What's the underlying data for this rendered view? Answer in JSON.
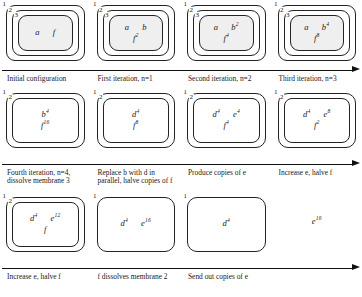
{
  "diagram": {
    "rows": [
      {
        "id": "row-1",
        "cells": [
          {
            "id": "cell-1-1",
            "membranes": [
              "1",
              "2",
              "3"
            ],
            "shaded_inner": true,
            "object_lines": [
              [
                {
                  "symbol": "a",
                  "exp": ""
                },
                {
                  "symbol": "f",
                  "exp": ""
                }
              ]
            ],
            "free_objects": []
          },
          {
            "id": "cell-1-2",
            "membranes": [
              "1",
              "2",
              "3"
            ],
            "shaded_inner": true,
            "object_lines": [
              [
                {
                  "symbol": "a",
                  "exp": ""
                },
                {
                  "symbol": "b",
                  "exp": ""
                }
              ],
              [
                {
                  "symbol": "f",
                  "exp": "2"
                }
              ]
            ],
            "free_objects": []
          },
          {
            "id": "cell-1-3",
            "membranes": [
              "1",
              "2",
              "3"
            ],
            "shaded_inner": true,
            "object_lines": [
              [
                {
                  "symbol": "a",
                  "exp": ""
                },
                {
                  "symbol": "b",
                  "exp": "2"
                }
              ],
              [
                {
                  "symbol": "f",
                  "exp": "4"
                }
              ]
            ],
            "free_objects": []
          },
          {
            "id": "cell-1-4",
            "membranes": [
              "1",
              "2",
              "3"
            ],
            "shaded_inner": true,
            "object_lines": [
              [
                {
                  "symbol": "a",
                  "exp": ""
                },
                {
                  "symbol": "b",
                  "exp": "4"
                }
              ],
              [
                {
                  "symbol": "f",
                  "exp": "8"
                }
              ]
            ],
            "free_objects": []
          }
        ],
        "captions": [
          "Initial configuration",
          "First iteration, n=1",
          "Second iteration, n=2",
          "Third iteration, n=3"
        ]
      },
      {
        "id": "row-2",
        "cells": [
          {
            "id": "cell-2-1",
            "membranes": [
              "1",
              "2"
            ],
            "shaded_inner": false,
            "object_lines": [
              [
                {
                  "symbol": "b",
                  "exp": "4"
                }
              ],
              [
                {
                  "symbol": "f",
                  "exp": "16"
                }
              ]
            ],
            "free_objects": []
          },
          {
            "id": "cell-2-2",
            "membranes": [
              "1",
              "2"
            ],
            "shaded_inner": false,
            "object_lines": [
              [
                {
                  "symbol": "d",
                  "exp": "4"
                }
              ],
              [
                {
                  "symbol": "f",
                  "exp": "8"
                }
              ]
            ],
            "free_objects": []
          },
          {
            "id": "cell-2-3",
            "membranes": [
              "1",
              "2"
            ],
            "shaded_inner": false,
            "object_lines": [
              [
                {
                  "symbol": "d",
                  "exp": "4"
                },
                {
                  "symbol": "e",
                  "exp": "4"
                }
              ],
              [
                {
                  "symbol": "f",
                  "exp": "4"
                }
              ]
            ],
            "free_objects": []
          },
          {
            "id": "cell-2-4",
            "membranes": [
              "1",
              "2"
            ],
            "shaded_inner": false,
            "object_lines": [
              [
                {
                  "symbol": "d",
                  "exp": "4"
                },
                {
                  "symbol": "e",
                  "exp": "8"
                }
              ],
              [
                {
                  "symbol": "f",
                  "exp": "2"
                }
              ]
            ],
            "free_objects": []
          }
        ],
        "captions": [
          "Fourth iteration, n=4, dissolve membrane 3",
          "Replace b with d in parallel, halve copies of f",
          "Produce copies of e",
          "Increase e, halve f"
        ]
      },
      {
        "id": "row-3",
        "cells": [
          {
            "id": "cell-3-1",
            "membranes": [
              "1",
              "2"
            ],
            "shaded_inner": false,
            "object_lines": [
              [
                {
                  "symbol": "d",
                  "exp": "4"
                },
                {
                  "symbol": "e",
                  "exp": "12"
                }
              ],
              [
                {
                  "symbol": "f",
                  "exp": ""
                }
              ]
            ],
            "free_objects": []
          },
          {
            "id": "cell-3-2",
            "membranes": [
              "1"
            ],
            "shaded_inner": false,
            "object_lines": [
              [
                {
                  "symbol": "d",
                  "exp": "4"
                },
                {
                  "symbol": "e",
                  "exp": "16"
                }
              ]
            ],
            "free_objects": []
          },
          {
            "id": "cell-3-3",
            "membranes": [
              "1"
            ],
            "shaded_inner": false,
            "object_lines": [
              [
                {
                  "symbol": "d",
                  "exp": "4"
                }
              ]
            ],
            "free_objects": []
          },
          {
            "id": "cell-3-4",
            "membranes": [],
            "shaded_inner": false,
            "object_lines": [],
            "free_objects": [
              {
                "symbol": "e",
                "exp": "16"
              }
            ]
          }
        ],
        "captions": [
          "Increase e, halve f",
          "f dissolves membrane 2",
          "Send out copies of e",
          ""
        ]
      }
    ]
  }
}
